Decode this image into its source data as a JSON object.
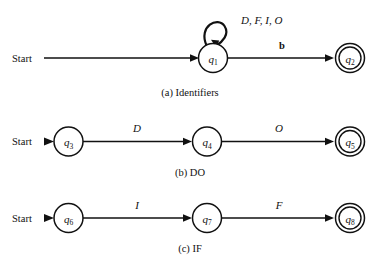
{
  "figure": {
    "background_color": "#ffffff",
    "ink_color": "#111111"
  },
  "diagrams": [
    {
      "id": "a",
      "caption": "(a) Identifiers",
      "start_label": "Start",
      "states": [
        {
          "id": "q1",
          "name": "q",
          "subscript": "1",
          "accepting": false
        },
        {
          "id": "q2",
          "name": "q",
          "subscript": "2",
          "accepting": true
        }
      ],
      "transitions": [
        {
          "from": "q1",
          "to": "q1",
          "label": "D, F, I, O",
          "self_loop": true
        },
        {
          "from": "q1",
          "to": "q2",
          "label": "b",
          "self_loop": false
        }
      ]
    },
    {
      "id": "b",
      "caption": "(b) DO",
      "start_label": "Start",
      "states": [
        {
          "id": "q3",
          "name": "q",
          "subscript": "3",
          "accepting": false
        },
        {
          "id": "q4",
          "name": "q",
          "subscript": "4",
          "accepting": false
        },
        {
          "id": "q5",
          "name": "q",
          "subscript": "5",
          "accepting": true
        }
      ],
      "transitions": [
        {
          "from": "q3",
          "to": "q4",
          "label": "D",
          "self_loop": false
        },
        {
          "from": "q4",
          "to": "q5",
          "label": "O",
          "self_loop": false
        }
      ]
    },
    {
      "id": "c",
      "caption": "(c) IF",
      "start_label": "Start",
      "states": [
        {
          "id": "q6",
          "name": "q",
          "subscript": "6",
          "accepting": false
        },
        {
          "id": "q7",
          "name": "q",
          "subscript": "7",
          "accepting": false
        },
        {
          "id": "q8",
          "name": "q",
          "subscript": "8",
          "accepting": true
        }
      ],
      "transitions": [
        {
          "from": "q6",
          "to": "q7",
          "label": "I",
          "self_loop": false
        },
        {
          "from": "q7",
          "to": "q8",
          "label": "F",
          "self_loop": false
        }
      ]
    }
  ]
}
